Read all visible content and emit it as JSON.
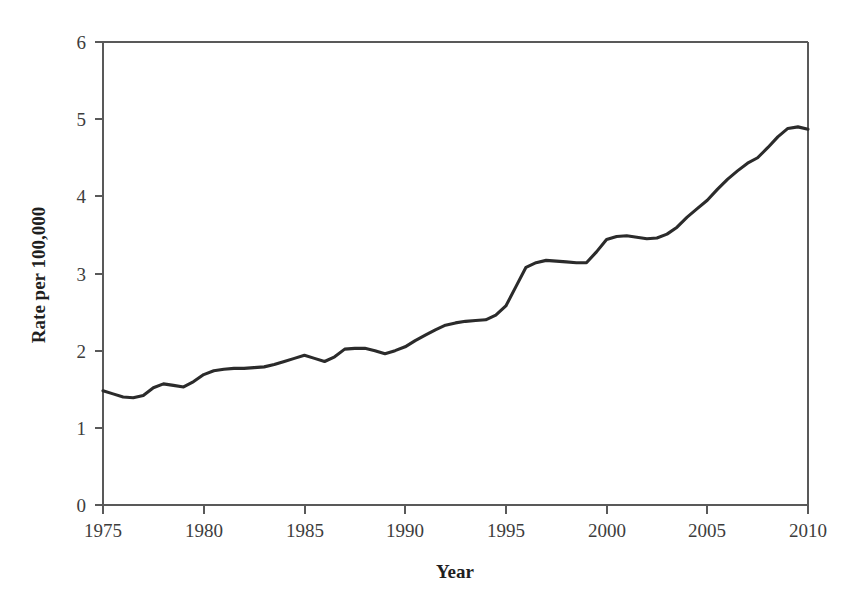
{
  "chart_data": {
    "type": "line",
    "title": "",
    "xlabel": "Year",
    "ylabel": "Rate per 100,000",
    "xlim": [
      1975,
      2010
    ],
    "ylim": [
      0,
      6
    ],
    "xticks": [
      1975,
      1980,
      1985,
      1990,
      1995,
      2000,
      2005,
      2010
    ],
    "yticks": [
      0,
      1,
      2,
      3,
      4,
      5,
      6
    ],
    "grid": false,
    "legend": null,
    "line_color": "#2b2b2b",
    "x": [
      1975,
      1976,
      1977,
      1978,
      1979,
      1980,
      1981,
      1982,
      1983,
      1984,
      1985,
      1986,
      1987,
      1988,
      1989,
      1990,
      1991,
      1992,
      1993,
      1994,
      1995,
      1996,
      1997,
      1998,
      1999,
      2000,
      2001,
      2002,
      2003,
      2004,
      2005,
      2006,
      2007,
      2008,
      2009,
      2010
    ],
    "values": [
      1.48,
      1.4,
      1.42,
      1.57,
      1.53,
      1.69,
      1.76,
      1.77,
      1.79,
      1.86,
      1.94,
      1.86,
      2.02,
      2.03,
      1.96,
      2.05,
      2.2,
      2.33,
      2.38,
      2.4,
      2.58,
      3.08,
      3.17,
      3.15,
      3.14,
      3.44,
      3.49,
      3.45,
      3.51,
      3.73,
      3.95,
      4.22,
      4.43,
      4.63,
      4.88,
      4.87
    ],
    "series": [
      {
        "name": "Rate per 100,000",
        "values": [
          1.48,
          1.4,
          1.42,
          1.57,
          1.53,
          1.69,
          1.76,
          1.77,
          1.79,
          1.86,
          1.94,
          1.86,
          2.02,
          2.03,
          1.96,
          2.05,
          2.2,
          2.33,
          2.38,
          2.4,
          2.58,
          3.08,
          3.17,
          3.15,
          3.14,
          3.44,
          3.49,
          3.45,
          3.51,
          3.73,
          3.95,
          4.22,
          4.43,
          4.63,
          4.88,
          4.87
        ]
      }
    ],
    "dense_x": [
      1975,
      1975.5,
      1976,
      1976.5,
      1977,
      1977.5,
      1978,
      1978.5,
      1979,
      1979.5,
      1980,
      1980.5,
      1981,
      1981.5,
      1982,
      1982.5,
      1983,
      1983.5,
      1984,
      1984.5,
      1985,
      1985.5,
      1986,
      1986.5,
      1987,
      1987.5,
      1988,
      1988.5,
      1989,
      1989.5,
      1990,
      1990.5,
      1991,
      1991.5,
      1992,
      1992.5,
      1993,
      1993.5,
      1994,
      1994.5,
      1995,
      1995.5,
      1996,
      1996.5,
      1997,
      1997.5,
      1998,
      1998.5,
      1999,
      1999.5,
      2000,
      2000.5,
      2001,
      2001.5,
      2002,
      2002.5,
      2003,
      2003.5,
      2004,
      2004.5,
      2005,
      2005.5,
      2006,
      2006.5,
      2007,
      2007.5,
      2008,
      2008.5,
      2009,
      2009.5,
      2010
    ],
    "dense_values": [
      1.48,
      1.44,
      1.4,
      1.39,
      1.42,
      1.52,
      1.57,
      1.55,
      1.53,
      1.6,
      1.69,
      1.74,
      1.76,
      1.77,
      1.77,
      1.78,
      1.79,
      1.82,
      1.86,
      1.9,
      1.94,
      1.9,
      1.86,
      1.92,
      2.02,
      2.03,
      2.03,
      2.0,
      1.96,
      2.0,
      2.05,
      2.13,
      2.2,
      2.27,
      2.33,
      2.36,
      2.38,
      2.39,
      2.4,
      2.46,
      2.58,
      2.83,
      3.08,
      3.14,
      3.17,
      3.16,
      3.15,
      3.14,
      3.14,
      3.28,
      3.44,
      3.48,
      3.49,
      3.47,
      3.45,
      3.46,
      3.51,
      3.6,
      3.73,
      3.84,
      3.95,
      4.09,
      4.22,
      4.33,
      4.43,
      4.5,
      4.63,
      4.77,
      4.88,
      4.9,
      4.87
    ]
  },
  "axes": {
    "y_title": "Rate per 100,000",
    "x_title": "Year",
    "y_tick_labels": [
      "6",
      "5",
      "4",
      "3",
      "2",
      "1",
      "0"
    ],
    "x_tick_labels": [
      "1975",
      "1980",
      "1985",
      "1990",
      "1995",
      "2000",
      "2005",
      "2010"
    ]
  }
}
